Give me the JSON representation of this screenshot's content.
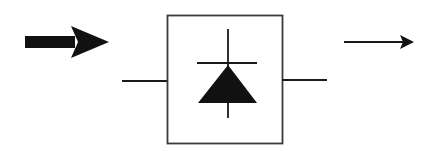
{
  "diagram": {
    "description": "Block diagram: thick input arrow, boxed diode/photodetector symbol with leads, thin output arrow",
    "colors": {
      "background": "#ffffff",
      "stroke": "#1a1a1a",
      "box_stroke": "#3a3a3a",
      "fill": "#111111"
    },
    "elements": {
      "input_arrow": {
        "label": "input-arrow",
        "style": "thick"
      },
      "component_box": {
        "label": "diode-component-box",
        "symbol": "diode"
      },
      "left_lead": {
        "label": "left-lead"
      },
      "right_lead": {
        "label": "right-lead"
      },
      "output_arrow": {
        "label": "output-arrow",
        "style": "thin"
      }
    }
  }
}
